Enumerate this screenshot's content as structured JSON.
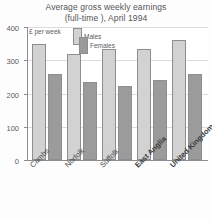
{
  "chart_data": {
    "type": "bar",
    "title": "Average gross weekly earnings (full-time ), April 1994",
    "title_line1": "Average gross weekly earnings",
    "title_line2": "(full-time ), April 1994",
    "xlabel": "",
    "ylabel": "£ per week",
    "ylim": [
      0,
      400
    ],
    "yticks": [
      0,
      100,
      200,
      300,
      400
    ],
    "ytick_labels": [
      "0",
      "100",
      "200",
      "300",
      "400"
    ],
    "grid": true,
    "legend_position": "top-left-inside",
    "categories": [
      "Cambs",
      "Norfolk",
      "Suffolk",
      "East Anglia",
      "United Kingdom"
    ],
    "categories_emphasis": [
      false,
      false,
      false,
      true,
      true
    ],
    "series": [
      {
        "name": "Males",
        "color": "#d2d2d2",
        "values": [
          350,
          320,
          333,
          333,
          360
        ]
      },
      {
        "name": "Females",
        "color": "#9b9b9b",
        "values": [
          258,
          235,
          223,
          240,
          260
        ]
      }
    ]
  },
  "colors": {
    "males": "#d2d2d2",
    "females": "#9b9b9b",
    "axis": "#8d8d90",
    "grid": "#dcdcdc",
    "text": "#555558",
    "background": "#fdfdfd"
  }
}
